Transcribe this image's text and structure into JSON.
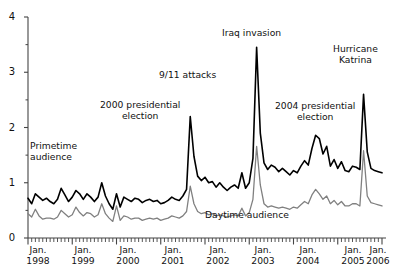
{
  "chart_data": {
    "type": "line",
    "title": "",
    "xlabel": "",
    "ylabel": "",
    "ylim": [
      0,
      4
    ],
    "yticks": [
      0,
      1,
      2,
      3,
      4
    ],
    "ytick_labels": [
      "0",
      "1",
      "2",
      "3",
      "4"
    ],
    "xlim": [
      "Jan. 1998",
      "Jan. 2006"
    ],
    "xtick_labels": [
      "Jan.\n1998",
      "Jan.\n1999",
      "Jan.\n2000",
      "Jan.\n2001",
      "Jan.\n2002",
      "Jan.\n2003",
      "Jan.\n2004",
      "Jan.\n2005",
      "Jan.\n2006"
    ],
    "xtick_years": [
      "1998",
      "1999",
      "2000",
      "2001",
      "2002",
      "2003",
      "2004",
      "2005",
      "2006"
    ],
    "xtick_month": "Jan.",
    "minor_ticks": "monthly",
    "grid": false,
    "legend": "inline-annotations",
    "series": [
      {
        "name": "Primetime audience",
        "color": "#000000",
        "width": 1.6,
        "values": [
          0.72,
          0.62,
          0.8,
          0.74,
          0.68,
          0.72,
          0.66,
          0.62,
          0.7,
          0.9,
          0.78,
          0.66,
          0.74,
          0.86,
          0.8,
          0.7,
          0.8,
          0.74,
          0.66,
          0.74,
          1.0,
          0.76,
          0.62,
          0.52,
          0.8,
          0.56,
          0.74,
          0.7,
          0.66,
          0.72,
          0.7,
          0.64,
          0.68,
          0.7,
          0.66,
          0.68,
          0.62,
          0.64,
          0.68,
          0.74,
          0.7,
          0.68,
          0.76,
          0.88,
          2.2,
          1.48,
          1.12,
          1.04,
          1.1,
          1.0,
          1.02,
          0.92,
          1.0,
          0.92,
          0.86,
          0.92,
          0.96,
          0.9,
          1.18,
          0.9,
          1.0,
          1.44,
          3.45,
          1.9,
          1.36,
          1.24,
          1.32,
          1.28,
          1.2,
          1.26,
          1.2,
          1.14,
          1.22,
          1.18,
          1.3,
          1.4,
          1.32,
          1.62,
          1.86,
          1.8,
          1.52,
          1.66,
          1.3,
          1.42,
          1.26,
          1.38,
          1.22,
          1.2,
          1.3,
          1.28,
          1.24,
          2.6,
          1.56,
          1.26,
          1.22,
          1.2,
          1.18
        ]
      },
      {
        "name": "Daytime audience",
        "color": "#808080",
        "width": 1.3,
        "values": [
          0.44,
          0.38,
          0.52,
          0.4,
          0.34,
          0.36,
          0.36,
          0.34,
          0.38,
          0.5,
          0.44,
          0.38,
          0.42,
          0.56,
          0.46,
          0.4,
          0.46,
          0.44,
          0.38,
          0.42,
          0.62,
          0.44,
          0.36,
          0.3,
          0.58,
          0.32,
          0.4,
          0.38,
          0.34,
          0.36,
          0.36,
          0.32,
          0.34,
          0.36,
          0.34,
          0.36,
          0.32,
          0.34,
          0.36,
          0.4,
          0.38,
          0.36,
          0.4,
          0.48,
          0.94,
          0.62,
          0.48,
          0.44,
          0.46,
          0.42,
          0.44,
          0.4,
          0.42,
          0.4,
          0.38,
          0.4,
          0.42,
          0.4,
          0.54,
          0.4,
          0.46,
          0.7,
          1.66,
          0.96,
          0.62,
          0.56,
          0.58,
          0.56,
          0.54,
          0.56,
          0.54,
          0.52,
          0.56,
          0.54,
          0.6,
          0.66,
          0.62,
          0.78,
          0.88,
          0.8,
          0.7,
          0.76,
          0.62,
          0.68,
          0.6,
          0.66,
          0.58,
          0.58,
          0.62,
          0.62,
          0.58,
          1.58,
          0.76,
          0.64,
          0.62,
          0.6,
          0.58
        ]
      }
    ],
    "annotations": [
      {
        "id": "primetime",
        "text": "Primetime\naudience",
        "line1": "Primetime",
        "line2": "audience"
      },
      {
        "id": "election2000",
        "text": "2000 presidential\nelection",
        "line1": "2000 presidential",
        "line2": "election"
      },
      {
        "id": "sept11",
        "text": "9/11 attacks",
        "line1": "9/11 attacks",
        "line2": ""
      },
      {
        "id": "iraq",
        "text": "Iraq invasion",
        "line1": "Iraq invasion",
        "line2": ""
      },
      {
        "id": "election2004",
        "text": "2004 presidential\nelection",
        "line1": "2004 presidential",
        "line2": "election"
      },
      {
        "id": "katrina",
        "text": "Hurricane\nKatrina",
        "line1": "Hurricane",
        "line2": "Katrina"
      },
      {
        "id": "daytime",
        "text": "Daytime audience",
        "line1": "Daytime audience",
        "line2": ""
      }
    ]
  },
  "axis": {
    "y": {
      "t0": "0",
      "t1": "1",
      "t2": "2",
      "t3": "3",
      "t4": "4"
    },
    "x": {
      "m0": "Jan.",
      "y0": "1998",
      "m1": "Jan.",
      "y1": "1999",
      "m2": "Jan.",
      "y2": "2000",
      "m3": "Jan.",
      "y3": "2001",
      "m4": "Jan.",
      "y4": "2002",
      "m5": "Jan.",
      "y5": "2003",
      "m6": "Jan.",
      "y6": "2004",
      "m7": "Jan.",
      "y7": "2005",
      "m8": "Jan.",
      "y8": "2006"
    }
  },
  "labels": {
    "primetime_l1": "Primetime",
    "primetime_l2": "audience",
    "election2000_l1": "2000 presidential",
    "election2000_l2": "election",
    "sept11": "9/11 attacks",
    "iraq": "Iraq invasion",
    "election2004_l1": "2004 presidential",
    "election2004_l2": "election",
    "katrina_l1": "Hurricane",
    "katrina_l2": "Katrina",
    "daytime": "Daytime audience"
  },
  "colors": {
    "primetime": "#000000",
    "daytime": "#808080",
    "axis": "#444444",
    "text": "#111111",
    "background": "#ffffff"
  }
}
